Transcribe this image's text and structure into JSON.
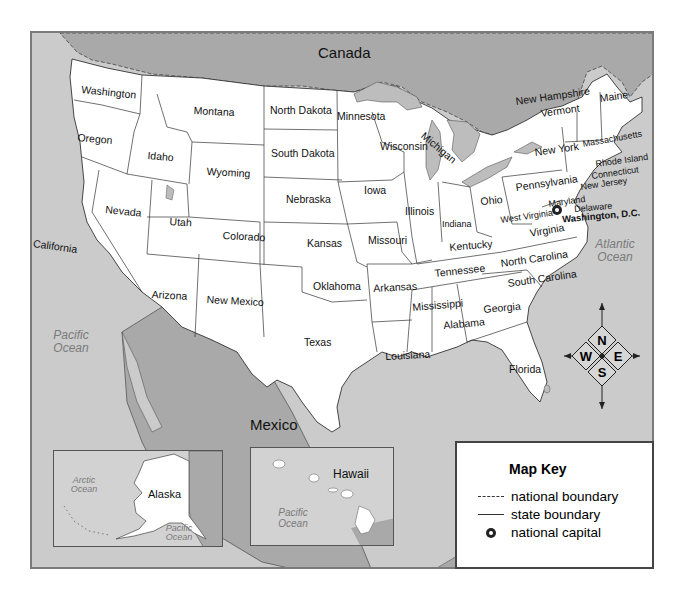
{
  "map": {
    "countries": {
      "canada": "Canada",
      "mexico": "Mexico"
    },
    "oceans": {
      "pacific": "Pacific Ocean",
      "atlantic": "Atlantic Ocean"
    },
    "states": [
      {
        "name": "Washington",
        "x": 80,
        "y": 82,
        "rot": 6
      },
      {
        "name": "Montana",
        "x": 192,
        "y": 103,
        "rot": 3
      },
      {
        "name": "North Dakota",
        "x": 268,
        "y": 103,
        "rot": 0
      },
      {
        "name": "Minnesota",
        "x": 335,
        "y": 109,
        "rot": 0
      },
      {
        "name": "Oregon",
        "x": 76,
        "y": 130,
        "rot": 5
      },
      {
        "name": "Idaho",
        "x": 146,
        "y": 148,
        "rot": 5
      },
      {
        "name": "South Dakota",
        "x": 269,
        "y": 146,
        "rot": 0
      },
      {
        "name": "Wisconsin",
        "x": 378,
        "y": 139,
        "rot": 0
      },
      {
        "name": "Wyoming",
        "x": 205,
        "y": 164,
        "rot": 3
      },
      {
        "name": "Nebraska",
        "x": 284,
        "y": 192,
        "rot": 0
      },
      {
        "name": "Iowa",
        "x": 362,
        "y": 183,
        "rot": 0
      },
      {
        "name": "Illinois",
        "x": 403,
        "y": 204,
        "rot": 0
      },
      {
        "name": "Indiana",
        "x": 440,
        "y": 218,
        "rot": 0
      },
      {
        "name": "Ohio",
        "x": 478,
        "y": 194,
        "rot": -5
      },
      {
        "name": "Pennsylvania",
        "x": 513,
        "y": 180,
        "rot": -8
      },
      {
        "name": "New York",
        "x": 532,
        "y": 145,
        "rot": -8
      },
      {
        "name": "Nevada",
        "x": 104,
        "y": 202,
        "rot": 6
      },
      {
        "name": "Utah",
        "x": 168,
        "y": 214,
        "rot": 4
      },
      {
        "name": "Colorado",
        "x": 221,
        "y": 228,
        "rot": 3
      },
      {
        "name": "Kansas",
        "x": 305,
        "y": 236,
        "rot": 0
      },
      {
        "name": "Missouri",
        "x": 366,
        "y": 233,
        "rot": 0
      },
      {
        "name": "Kentucky",
        "x": 447,
        "y": 240,
        "rot": -5
      },
      {
        "name": "West Virginia",
        "x": 498,
        "y": 214,
        "rot": -8
      },
      {
        "name": "Virginia",
        "x": 527,
        "y": 226,
        "rot": -10
      },
      {
        "name": "California",
        "x": 32,
        "y": 236,
        "rot": 8
      },
      {
        "name": "Arizona",
        "x": 150,
        "y": 287,
        "rot": 3
      },
      {
        "name": "New Mexico",
        "x": 205,
        "y": 292,
        "rot": 3
      },
      {
        "name": "Oklahoma",
        "x": 311,
        "y": 279,
        "rot": 0
      },
      {
        "name": "Arkansas",
        "x": 371,
        "y": 281,
        "rot": -3
      },
      {
        "name": "Tennessee",
        "x": 432,
        "y": 266,
        "rot": -6
      },
      {
        "name": "North Carolina",
        "x": 498,
        "y": 256,
        "rot": -8
      },
      {
        "name": "South Carolina",
        "x": 505,
        "y": 276,
        "rot": -8
      },
      {
        "name": "Mississippi",
        "x": 410,
        "y": 300,
        "rot": -5
      },
      {
        "name": "Alabama",
        "x": 441,
        "y": 318,
        "rot": -5
      },
      {
        "name": "Georgia",
        "x": 481,
        "y": 302,
        "rot": -5
      },
      {
        "name": "Texas",
        "x": 302,
        "y": 335,
        "rot": 0
      },
      {
        "name": "Louisiana",
        "x": 383,
        "y": 349,
        "rot": -3
      },
      {
        "name": "Florida",
        "x": 507,
        "y": 362,
        "rot": 0
      },
      {
        "name": "Maine",
        "x": 597,
        "y": 91,
        "rot": -8
      },
      {
        "name": "New Hampshire",
        "x": 513,
        "y": 94,
        "rot": -8
      },
      {
        "name": "Vermont",
        "x": 538,
        "y": 106,
        "rot": -8
      },
      {
        "name": "Massachusetts",
        "x": 580,
        "y": 138,
        "rot": -10
      },
      {
        "name": "Rhode Island",
        "x": 593,
        "y": 158,
        "rot": -8
      },
      {
        "name": "Connecticut",
        "x": 589,
        "y": 170,
        "rot": -8
      },
      {
        "name": "New Jersey",
        "x": 578,
        "y": 181,
        "rot": -8
      },
      {
        "name": "Maryland",
        "x": 546,
        "y": 198,
        "rot": -8
      },
      {
        "name": "Delaware",
        "x": 572,
        "y": 203,
        "rot": -5
      },
      {
        "name": "Michigan",
        "x": 424,
        "y": 128,
        "rot": 40
      }
    ],
    "capital": {
      "name": "Washington, D.C.",
      "x": 557,
      "y": 215
    },
    "compass": {
      "n": "N",
      "s": "S",
      "e": "E",
      "w": "W"
    },
    "insets": {
      "alaska": {
        "title": "Alaska",
        "ocean_north": "Arctic Ocean",
        "ocean_south": "Pacific Ocean"
      },
      "hawaii": {
        "title": "Hawaii",
        "ocean": "Pacific Ocean"
      }
    }
  },
  "map_key": {
    "title": "Map Key",
    "items": [
      {
        "symbol": "dashed-line",
        "label": "national boundary"
      },
      {
        "symbol": "solid-line",
        "label": "state boundary"
      },
      {
        "symbol": "star-circle",
        "label": "national capital"
      }
    ]
  },
  "colors": {
    "land": "#ffffff",
    "water": "#c9c9c9",
    "foreign": "#a8a8a8",
    "lakes": "#bdbdbd",
    "border": "#333333"
  }
}
